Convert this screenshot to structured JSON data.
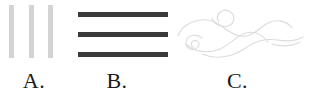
{
  "figure": {
    "background_color": "#ffffff",
    "width": 309,
    "height": 105
  },
  "options": [
    {
      "id": "a",
      "label": "A.",
      "pattern_name": "vertical-lines-pattern",
      "stroke_color": "#d3d3d3",
      "stroke_count": 3,
      "orientation": "vertical",
      "weight": "light"
    },
    {
      "id": "b",
      "label": "B.",
      "pattern_name": "horizontal-lines-pattern",
      "stroke_color": "#3a3a3a",
      "stroke_count": 3,
      "orientation": "horizontal",
      "weight": "heavy"
    },
    {
      "id": "c",
      "label": "C.",
      "pattern_name": "wind-swirl-pattern",
      "stroke_color": "#dcdcdc",
      "stroke_count": 1,
      "orientation": "curved",
      "weight": "light"
    }
  ]
}
